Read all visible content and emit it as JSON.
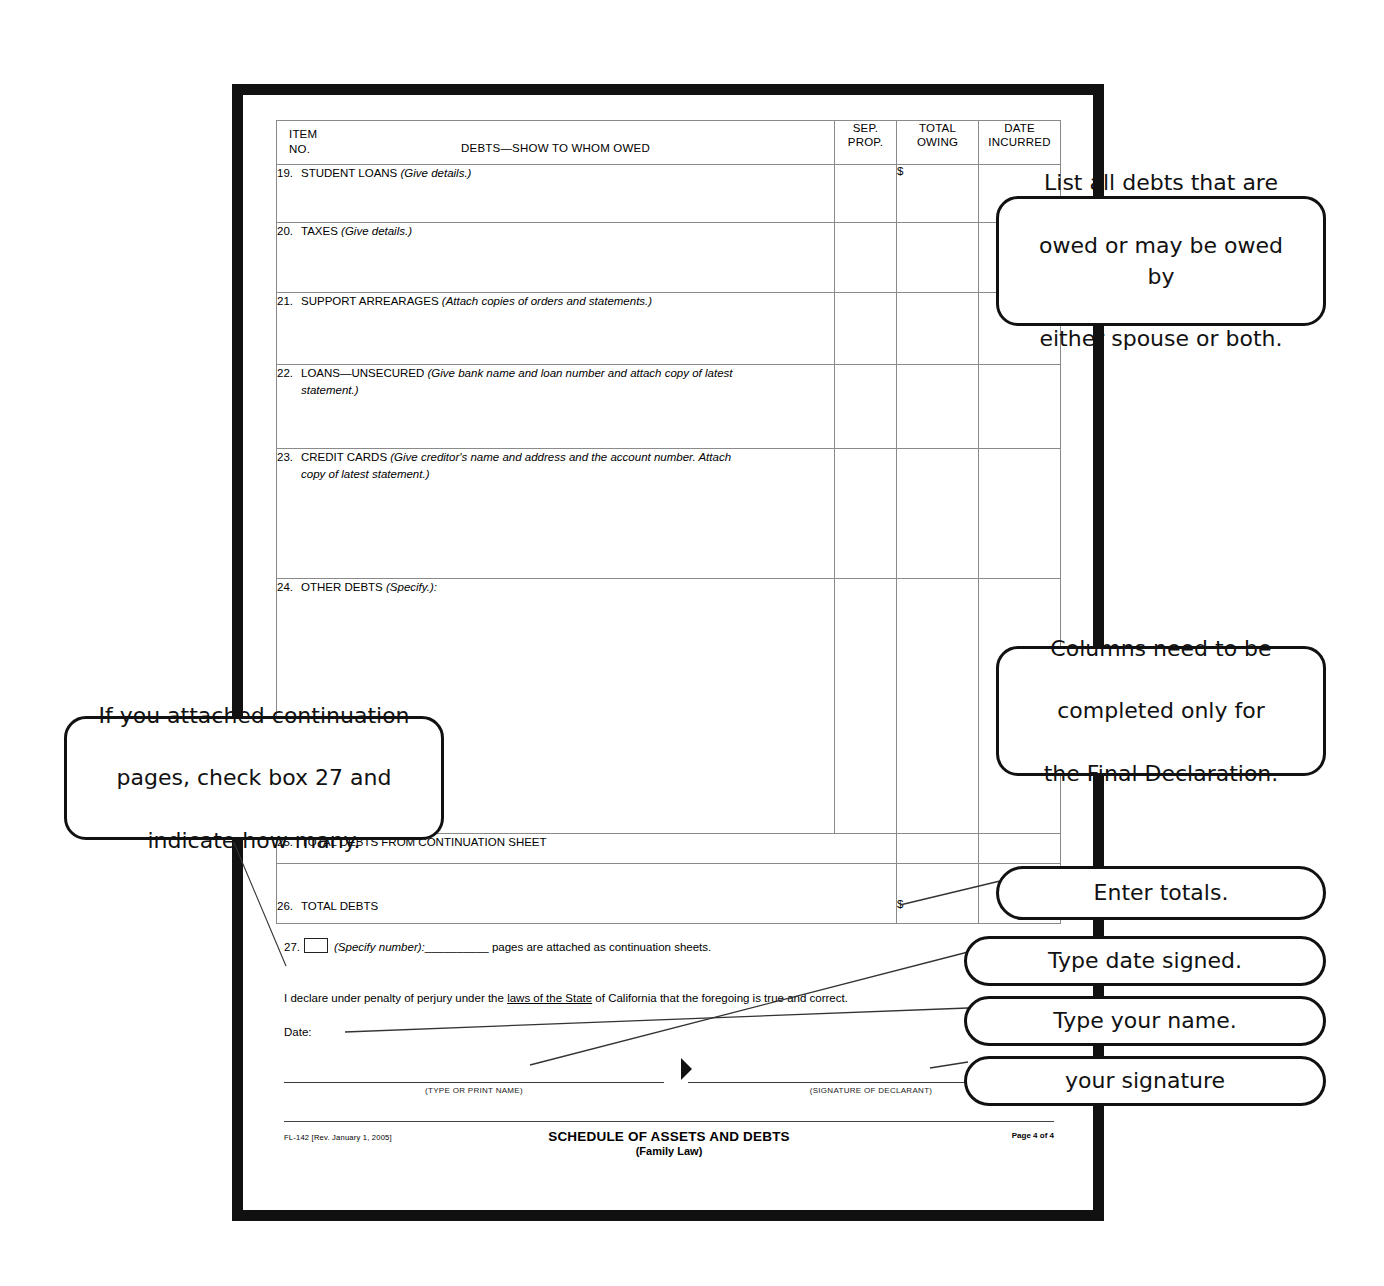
{
  "document": {
    "form_code": "FL-142 [Rev. January 1, 2005]",
    "footer_title": "SCHEDULE OF ASSETS AND DEBTS",
    "footer_subtitle": "(Family Law)",
    "page_number": "Page 4 of 4"
  },
  "table": {
    "headers": {
      "item_no_line1": "ITEM",
      "item_no_line2": "NO.",
      "description": "DEBTS—SHOW TO WHOM OWED",
      "sep_prop_line1": "SEP.",
      "sep_prop_line2": "PROP.",
      "total_owing_line1": "TOTAL",
      "total_owing_line2": "OWING",
      "date_incurred_line1": "DATE",
      "date_incurred_line2": "INCURRED"
    },
    "currency_symbol": "$",
    "rows": [
      {
        "number": "19.",
        "label": "STUDENT LOANS",
        "hint": "(Give details.)",
        "hint2": "",
        "sep_prop": "",
        "total_owing": "$",
        "date_incurred": ""
      },
      {
        "number": "20.",
        "label": "TAXES",
        "hint": "(Give details.)",
        "hint2": "",
        "sep_prop": "",
        "total_owing": "",
        "date_incurred": ""
      },
      {
        "number": "21.",
        "label": "SUPPORT ARREARAGES",
        "hint": "(Attach copies of orders and statements.)",
        "hint2": "",
        "sep_prop": "",
        "total_owing": "",
        "date_incurred": ""
      },
      {
        "number": "22.",
        "label": "LOANS—UNSECURED",
        "hint": "(Give bank name and loan number and attach copy of latest",
        "hint2": "statement.)",
        "sep_prop": "",
        "total_owing": "",
        "date_incurred": ""
      },
      {
        "number": "23.",
        "label": "CREDIT CARDS",
        "hint": "(Give creditor's name and address and the account number. Attach",
        "hint2": "copy of latest statement.)",
        "sep_prop": "",
        "total_owing": "",
        "date_incurred": ""
      },
      {
        "number": "24.",
        "label": "OTHER DEBTS",
        "hint": "(Specify.):",
        "hint2": "",
        "sep_prop": "",
        "total_owing": "",
        "date_incurred": ""
      }
    ],
    "total_rows": [
      {
        "number": "25.",
        "label": "TOTAL DEBTS FROM CONTINUATION SHEET",
        "total_owing": ""
      },
      {
        "number": "26.",
        "label": "TOTAL DEBTS",
        "total_owing": "$"
      }
    ]
  },
  "declaration": {
    "item27_number": "27.",
    "item27_checkbox_value": "",
    "item27_specify": "(Specify number):",
    "item27_blank": "__________",
    "item27_tail": "pages are attached as continuation sheets.",
    "perjury_part1": "I declare under penalty of perjury under the ",
    "perjury_underlined": "laws of the State",
    "perjury_part2": " of California that the foregoing is true and correct.",
    "date_label": "Date:",
    "date_value": "",
    "name_caption": "(TYPE OR PRINT NAME)",
    "signature_caption": "(SIGNATURE OF DECLARANT)",
    "typed_name_value": "",
    "signature_value": ""
  },
  "callouts": [
    {
      "id": "debts",
      "lines": [
        "List all debts that are",
        "owed or may be owed by",
        "either spouse or both."
      ]
    },
    {
      "id": "columns",
      "lines": [
        "Columns need to be",
        "completed only for",
        "the Final Declaration."
      ]
    },
    {
      "id": "continuation",
      "lines": [
        "If you attached continuation",
        "pages, check box 27 and",
        "indicate  how  many."
      ]
    },
    {
      "id": "totals",
      "lines": [
        "Enter totals."
      ]
    },
    {
      "id": "date-signed",
      "lines": [
        "Type date signed."
      ]
    },
    {
      "id": "your-name",
      "lines": [
        "Type your name."
      ]
    },
    {
      "id": "signature",
      "lines": [
        "your  signature"
      ]
    }
  ],
  "colors": {
    "frame": "#111111",
    "rule": "#8a8a8a",
    "text": "#000000",
    "paper": "#ffffff"
  }
}
